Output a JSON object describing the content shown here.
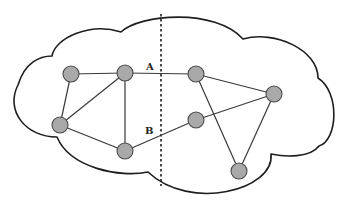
{
  "diagram": {
    "type": "network-partition",
    "colors": {
      "node_fill": "#a9a9a9",
      "node_stroke": "#4a4a4a",
      "edge": "#3a3a3a",
      "cloud_stroke": "#1e1e1e",
      "background": "#ffffff"
    },
    "nodes": [
      {
        "id": "n1",
        "x": 71,
        "y": 74
      },
      {
        "id": "n2",
        "x": 125,
        "y": 73
      },
      {
        "id": "n3",
        "x": 60,
        "y": 125
      },
      {
        "id": "n4",
        "x": 125,
        "y": 151
      },
      {
        "id": "n5",
        "x": 196,
        "y": 74
      },
      {
        "id": "n6",
        "x": 196,
        "y": 120
      },
      {
        "id": "n7",
        "x": 274,
        "y": 94
      },
      {
        "id": "n8",
        "x": 239,
        "y": 171
      }
    ],
    "edges": [
      {
        "from": "n1",
        "to": "n2"
      },
      {
        "from": "n1",
        "to": "n3"
      },
      {
        "from": "n2",
        "to": "n3"
      },
      {
        "from": "n2",
        "to": "n4"
      },
      {
        "from": "n3",
        "to": "n4"
      },
      {
        "from": "n2",
        "to": "n5",
        "label": "A"
      },
      {
        "from": "n4",
        "to": "n6",
        "label": "B"
      },
      {
        "from": "n5",
        "to": "n7"
      },
      {
        "from": "n5",
        "to": "n8"
      },
      {
        "from": "n6",
        "to": "n7"
      },
      {
        "from": "n7",
        "to": "n8"
      }
    ],
    "labels": [
      {
        "text": "A",
        "x": 146,
        "y": 70
      },
      {
        "text": "B",
        "x": 145,
        "y": 134
      }
    ],
    "cut_line": {
      "x": 161,
      "y1": 14,
      "y2": 186,
      "style": "dashed"
    }
  }
}
